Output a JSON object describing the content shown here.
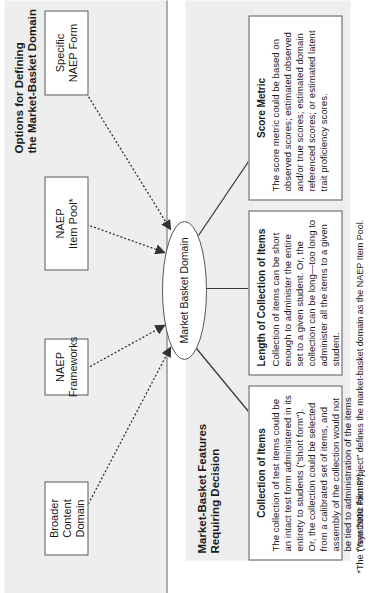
{
  "options_panel": {
    "title": "Options for Defining\nthe Market-Basket Domain",
    "options": [
      {
        "label": "Broader Content\nDomain"
      },
      {
        "label": "NAEP\nFrameworks"
      },
      {
        "label": "NAEP\nItem Pool*"
      },
      {
        "label": "Specific\nNAEP Form"
      }
    ]
  },
  "center_node": {
    "label": "Market Basket Domain"
  },
  "features_panel": {
    "title": "Market-Basket Features\nRequiring Decision",
    "features": [
      {
        "title": "Collection of Items",
        "text": "The collection of test items could be an intact test form administered in its entirety to students (\"short form\"). Or, the collection could be selected from a calibrated set of items, and assembly of the collection would not be tied to administration of the items (\"synthetic forms\")."
      },
      {
        "title": "Length of Collection of Items",
        "text": "Collection of items can be short enough to administer the entire set to a given student. Or, the collection can be long—too long to administer all the items to a given student."
      },
      {
        "title": "Score Metric",
        "text": "The score metric could be based on observed scores; estimated observed and/or true scores; estimated domain referenced scores; or estimated latent trait proficiency scores."
      }
    ]
  },
  "footnote": "*The “Year 2000 Pilot Project” defines the market-basket domain as the NAEP Item Pool.",
  "colors": {
    "panel_bg": "#eeeeee",
    "box_bg": "#ffffff",
    "line": "#333333"
  }
}
